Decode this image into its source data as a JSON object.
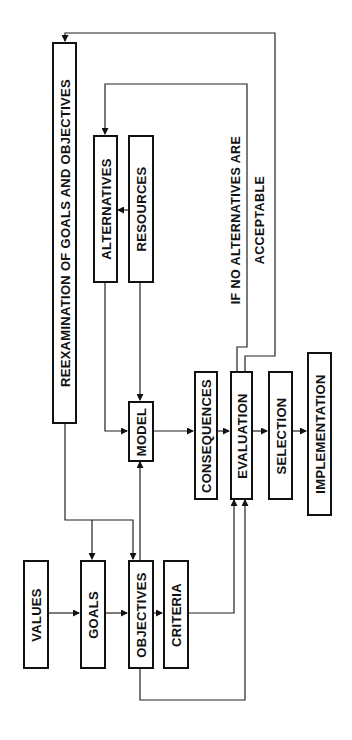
{
  "diagram": {
    "type": "flowchart",
    "orientation": "rotated-90-ccw",
    "nodes": [
      {
        "id": "reexamination",
        "label": "REEXAMINATION OF GOALS AND OBJECTIVES"
      },
      {
        "id": "alternatives",
        "label": "ALTERNATIVES"
      },
      {
        "id": "resources",
        "label": "RESOURCES"
      },
      {
        "id": "model",
        "label": "MODEL"
      },
      {
        "id": "consequences",
        "label": "CONSEQUENCES"
      },
      {
        "id": "evaluation",
        "label": "EVALUATION"
      },
      {
        "id": "selection",
        "label": "SELECTION"
      },
      {
        "id": "implementation",
        "label": "IMPLEMENTATION"
      },
      {
        "id": "values",
        "label": "VALUES"
      },
      {
        "id": "goals",
        "label": "GOALS"
      },
      {
        "id": "objectives",
        "label": "OBJECTIVES"
      },
      {
        "id": "criteria",
        "label": "CRITERIA"
      }
    ],
    "annotation": {
      "line1": "IF NO ALTERNATIVES ARE",
      "line2": "ACCEPTABLE"
    },
    "edges": [
      {
        "from": "values",
        "to": "goals"
      },
      {
        "from": "goals",
        "to": "objectives"
      },
      {
        "from": "objectives",
        "to": "criteria"
      },
      {
        "from": "objectives",
        "to": "model"
      },
      {
        "from": "objectives",
        "to": "evaluation"
      },
      {
        "from": "criteria",
        "to": "evaluation"
      },
      {
        "from": "resources",
        "to": "alternatives"
      },
      {
        "from": "resources",
        "to": "model"
      },
      {
        "from": "alternatives",
        "to": "model"
      },
      {
        "from": "model",
        "to": "consequences"
      },
      {
        "from": "consequences",
        "to": "evaluation"
      },
      {
        "from": "evaluation",
        "to": "selection"
      },
      {
        "from": "selection",
        "to": "implementation"
      },
      {
        "from": "evaluation",
        "to": "alternatives",
        "label": "IF NO ALTERNATIVES ARE ACCEPTABLE"
      },
      {
        "from": "evaluation",
        "to": "reexamination"
      },
      {
        "from": "reexamination",
        "to": "goals"
      },
      {
        "from": "reexamination",
        "to": "objectives"
      }
    ]
  }
}
